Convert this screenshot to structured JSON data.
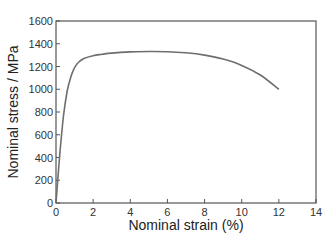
{
  "chart_data": {
    "type": "line",
    "title": "",
    "xlabel": "Nominal strain (%)",
    "ylabel": "Nominal stress / MPa",
    "xlim": [
      0,
      14
    ],
    "ylim": [
      0,
      1600
    ],
    "xticks": [
      "0",
      "2",
      "4",
      "6",
      "8",
      "10",
      "12",
      "14"
    ],
    "yticks": [
      "0",
      "200",
      "400",
      "600",
      "800",
      "1000",
      "1200",
      "1400",
      "1600"
    ],
    "grid": false,
    "legend": null,
    "series": [
      {
        "name": "stress-strain",
        "color": "#6e6e6e",
        "x": [
          0,
          0.2,
          0.4,
          0.6,
          0.8,
          1.0,
          1.2,
          1.5,
          2.0,
          2.5,
          3.0,
          4.0,
          5.0,
          6.0,
          7.0,
          8.0,
          9.0,
          10.0,
          11.0,
          12.0
        ],
        "y": [
          0,
          420,
          760,
          980,
          1110,
          1190,
          1235,
          1270,
          1295,
          1308,
          1318,
          1328,
          1332,
          1330,
          1320,
          1300,
          1265,
          1210,
          1125,
          1000
        ]
      }
    ]
  }
}
